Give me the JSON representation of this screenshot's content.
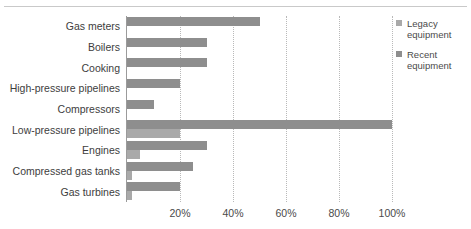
{
  "figure": {
    "top_cropped_text": "",
    "background": "#ffffff"
  },
  "legend": {
    "position": "right",
    "items": [
      {
        "label_line1": "Legacy",
        "label_line2": "equipment",
        "color": "#a9a9a9",
        "key": "legacy"
      },
      {
        "label_line1": "Recent",
        "label_line2": "equipment",
        "color": "#8e8e8e",
        "key": "recent"
      }
    ]
  },
  "axis": {
    "x_ticks": [
      "20%",
      "40%",
      "60%",
      "80%",
      "100%"
    ],
    "x_tick_values": [
      20,
      40,
      60,
      80,
      100
    ]
  },
  "chart_data": {
    "type": "bar",
    "orientation": "horizontal",
    "title": "",
    "xlabel": "",
    "ylabel": "",
    "xlim": [
      0,
      100
    ],
    "ylim": null,
    "grid": "vertical-dotted",
    "legend_position": "right",
    "tick_suffix": "%",
    "categories": [
      "Gas meters",
      "Boilers",
      "Cooking",
      "High-pressure pipelines",
      "Compressors",
      "Low-pressure pipelines",
      "Engines",
      "Compressed gas tanks",
      "Gas turbines"
    ],
    "series": [
      {
        "name": "Recent equipment",
        "color": "#8e8e8e",
        "values": [
          50,
          30,
          30,
          20,
          10,
          100,
          30,
          25,
          20
        ]
      },
      {
        "name": "Legacy equipment",
        "color": "#a9a9a9",
        "values": [
          0,
          0,
          0,
          0,
          0,
          20,
          5,
          2,
          2
        ]
      }
    ],
    "colors": {
      "recent": "#8e8e8e",
      "legacy": "#a9a9a9",
      "gridline": "#b9b9b9",
      "axis": "#9b9b9b",
      "text": "#3d3d3d"
    }
  }
}
